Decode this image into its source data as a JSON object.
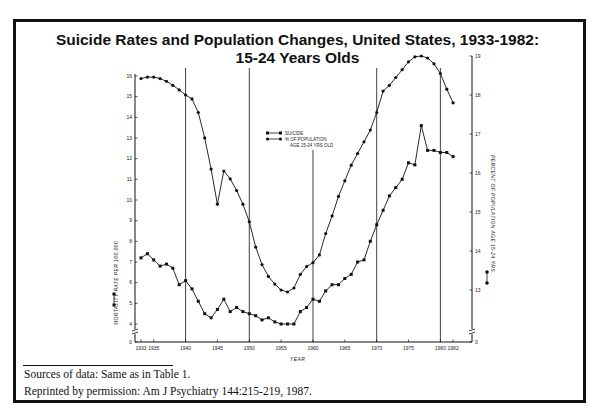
{
  "title": {
    "line1": "Suicide Rates and Population Changes, United States, 1933-1982:",
    "line2": "15-24 Years Olds"
  },
  "footnotes": {
    "sources": "Sources of data:  Same as in Table 1.",
    "reprint": "Reprinted by permission:  Am J Psychiatry 144:215-219, 1987."
  },
  "legend": {
    "suicide": "SUICIDE",
    "population_line1": "% OF POPULATION",
    "population_line2": "AGE 15-24 YRS OLD"
  },
  "colors": {
    "ink": "#111111",
    "background": "#ffffff"
  },
  "chart_data": {
    "type": "line",
    "xlabel": "YEAR",
    "ylabel": "MORTALITY RATE PER 100,000",
    "y2label": "PERCENT OF POPULATION AGE 15-24 YRS.",
    "x_ticks": [
      "1933",
      "1935",
      "1940",
      "1945",
      "1950",
      "1955",
      "1960",
      "1965",
      "1970",
      "1975",
      "1980",
      "1982"
    ],
    "y_ticks": [
      0,
      4,
      5,
      6,
      7,
      8,
      9,
      10,
      11,
      12,
      13,
      14,
      15,
      16
    ],
    "y2_ticks": [
      0,
      13,
      14,
      15,
      16,
      17,
      18,
      19
    ],
    "ylim": [
      0,
      16
    ],
    "y2lim": [
      0,
      19
    ],
    "axis_break": true,
    "grid": "vertical lines at 1940, 1950, 1960, 1970, 1980",
    "vlines": [
      1940,
      1950,
      1960,
      1970,
      1980
    ],
    "legend_position": "upper center",
    "x": [
      1933,
      1934,
      1935,
      1936,
      1937,
      1938,
      1939,
      1940,
      1941,
      1942,
      1943,
      1944,
      1945,
      1946,
      1947,
      1948,
      1949,
      1950,
      1951,
      1952,
      1953,
      1954,
      1955,
      1956,
      1957,
      1958,
      1959,
      1960,
      1961,
      1962,
      1963,
      1964,
      1965,
      1966,
      1967,
      1968,
      1969,
      1970,
      1971,
      1972,
      1973,
      1974,
      1975,
      1976,
      1977,
      1978,
      1979,
      1980,
      1981,
      1982
    ],
    "series": [
      {
        "name": "SUICIDE",
        "axis": "left",
        "values": [
          7.2,
          7.4,
          7.1,
          6.8,
          6.9,
          6.7,
          5.9,
          6.1,
          5.7,
          5.1,
          4.5,
          4.3,
          4.7,
          5.2,
          4.6,
          4.8,
          4.6,
          4.5,
          4.4,
          4.2,
          4.3,
          4.1,
          4.0,
          4.0,
          4.0,
          4.6,
          4.8,
          5.2,
          5.1,
          5.6,
          5.9,
          5.9,
          6.2,
          6.4,
          7.0,
          7.1,
          8.0,
          8.8,
          9.5,
          10.2,
          10.6,
          11.0,
          11.8,
          11.7,
          13.6,
          12.4,
          12.4,
          12.3,
          12.3,
          12.1
        ]
      },
      {
        "name": "% OF POPULATION AGE 15-24 YRS OLD",
        "axis": "right",
        "values": [
          18.42,
          18.46,
          18.46,
          18.42,
          18.35,
          18.25,
          18.13,
          18.0,
          17.9,
          17.55,
          16.9,
          16.1,
          15.2,
          16.05,
          15.85,
          15.55,
          15.2,
          14.75,
          14.1,
          13.65,
          13.35,
          13.15,
          13.0,
          12.95,
          13.05,
          13.4,
          13.6,
          13.7,
          13.9,
          14.45,
          14.9,
          15.4,
          15.8,
          16.2,
          16.5,
          16.8,
          17.1,
          17.55,
          18.1,
          18.25,
          18.45,
          18.65,
          18.85,
          18.98,
          19.0,
          18.95,
          18.8,
          18.55,
          18.15,
          17.8
        ]
      }
    ]
  }
}
